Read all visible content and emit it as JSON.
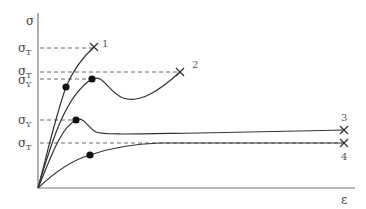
{
  "diagram": {
    "axes": {
      "y_label": "σ",
      "x_label": "ε"
    },
    "stress_levels": [
      {
        "symbol": "σ",
        "subscript": "T",
        "y": 48
      },
      {
        "symbol": "σ",
        "subscript": "T",
        "y": 72
      },
      {
        "symbol": "σ",
        "subscript": "Y",
        "y": 79
      },
      {
        "symbol": "σ",
        "subscript": "Y",
        "y": 120
      },
      {
        "symbol": "σ",
        "subscript": "T",
        "y": 143
      }
    ],
    "curves": [
      {
        "id": "1",
        "label": "1",
        "yield_point": true,
        "end": "fracture"
      },
      {
        "id": "2",
        "label": "2",
        "yield_point": true,
        "end": "fracture"
      },
      {
        "id": "3",
        "label": "3",
        "yield_point": true,
        "end": "fracture"
      },
      {
        "id": "4",
        "label": "4",
        "yield_point": true,
        "end": "fracture"
      }
    ]
  }
}
